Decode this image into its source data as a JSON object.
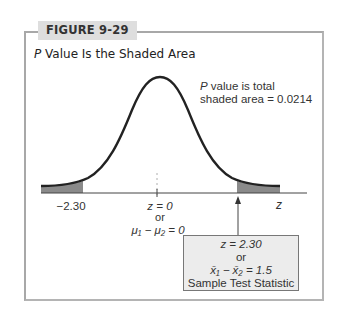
{
  "figure": {
    "label": "FIGURE 9-29",
    "title_italic": "P",
    "title_rest": " Value Is the Shaded Area"
  },
  "annotation": {
    "line1_italic": "P",
    "line1_rest": " value is total",
    "line2": "shaded area = 0.0214"
  },
  "axis": {
    "left_tick": "−2.30",
    "center_line1": "z = 0",
    "center_line2": "or",
    "center_line3": "μ₁ − μ₂ = 0",
    "axis_label": "z"
  },
  "stat_box": {
    "line1": "z = 2.30",
    "line2": "or",
    "line3": "x̄₁ − x̄₂ = 1.5",
    "line4": "Sample Test Statistic"
  },
  "colors": {
    "shade": "#8a8a8a",
    "curve": "#222222",
    "frame": "#a8a8a8",
    "label_bg": "#dedede",
    "box_bg": "#ececec"
  }
}
